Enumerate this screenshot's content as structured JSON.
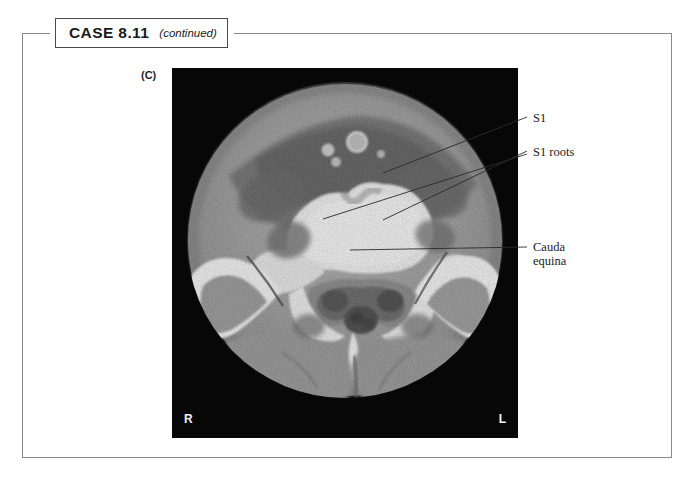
{
  "header": {
    "case_label": "CASE 8.11",
    "continued_label": "(continued)"
  },
  "figure": {
    "panel_letter": "(C)",
    "modality": "ct-axial-sacrum",
    "orientation_markers": {
      "right": "R",
      "left": "L"
    },
    "annotations": [
      {
        "id": "s1",
        "label": "S1"
      },
      {
        "id": "s1-roots",
        "label": "S1 roots"
      },
      {
        "id": "cauda-equina",
        "label_line1": "Cauda",
        "label_line2": "equina"
      }
    ]
  },
  "colors": {
    "frame": "#8a8a8a",
    "box_border": "#4a4a4a",
    "text": "#1a1a1a",
    "panel_background": "#070707",
    "marker_text": "#f2f2f2",
    "leader_line": "#2b2b2b"
  }
}
